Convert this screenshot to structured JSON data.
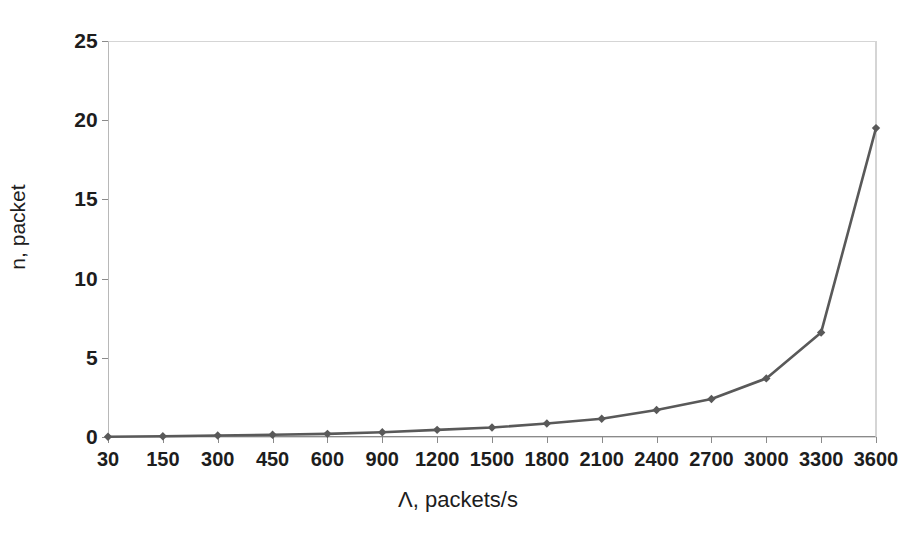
{
  "chart_data": {
    "type": "line",
    "title": "",
    "subtitle": "",
    "xlabel": "Λ, packets/s",
    "ylabel": "n, packet",
    "categories": [
      "30",
      "150",
      "300",
      "450",
      "600",
      "900",
      "1200",
      "1500",
      "1800",
      "2100",
      "2400",
      "2700",
      "3000",
      "3300",
      "3600"
    ],
    "x": [
      30,
      150,
      300,
      450,
      600,
      900,
      1200,
      1500,
      1800,
      2100,
      2400,
      2700,
      3000,
      3300,
      3600
    ],
    "values": [
      0.02,
      0.05,
      0.09,
      0.14,
      0.2,
      0.3,
      0.45,
      0.6,
      0.85,
      1.15,
      1.7,
      2.4,
      3.7,
      6.6,
      19.5
    ],
    "series": [
      {
        "name": "n",
        "values": [
          0.02,
          0.05,
          0.09,
          0.14,
          0.2,
          0.3,
          0.45,
          0.6,
          0.85,
          1.15,
          1.7,
          2.4,
          3.7,
          6.6,
          19.5
        ]
      }
    ],
    "ylim": [
      0,
      25
    ],
    "yticks": [
      0,
      5,
      10,
      15,
      20,
      25
    ],
    "ytick_labels": [
      "0",
      "5",
      "10",
      "15",
      "20",
      "25"
    ],
    "x_axis_scale": "categorical",
    "grid": true,
    "grid_x": true,
    "grid_y": true,
    "legend": false,
    "legend_position": "none",
    "marker": "diamond",
    "line_color": "#595959",
    "marker_color": "#595959",
    "grid_color": "#d5d5d5",
    "background_color": "#ffffff",
    "text_color": "#1d1d1d",
    "annotations": []
  }
}
